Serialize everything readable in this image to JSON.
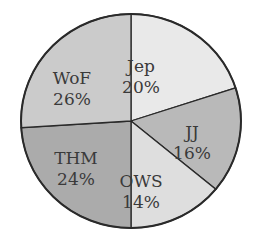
{
  "chart_data": {
    "type": "pie",
    "title": "",
    "start_angle_deg": 0,
    "direction": "clockwise",
    "slices": [
      {
        "label": "Jep",
        "value": 20,
        "display": "20%",
        "color": "#e9e9e9"
      },
      {
        "label": "JJ",
        "value": 16,
        "display": "16%",
        "color": "#b9b9b9"
      },
      {
        "label": "OWS",
        "value": 14,
        "display": "14%",
        "color": "#dedede"
      },
      {
        "label": "THM",
        "value": 24,
        "display": "24%",
        "color": "#ababab"
      },
      {
        "label": "WoF",
        "value": 26,
        "display": "26%",
        "color": "#cbcbcb"
      }
    ],
    "categories": [
      "Jep",
      "JJ",
      "OWS",
      "THM",
      "WoF"
    ],
    "values": [
      20,
      16,
      14,
      24,
      26
    ]
  }
}
